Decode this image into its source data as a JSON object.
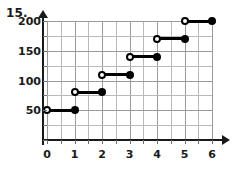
{
  "problem": {
    "number": "15."
  },
  "chart_data": {
    "type": "line",
    "title": "",
    "xlabel": "",
    "ylabel": "",
    "xlim": [
      0,
      6
    ],
    "ylim": [
      0,
      200
    ],
    "grid": true,
    "legend": null,
    "x_ticks": [
      "0",
      "1",
      "2",
      "3",
      "4",
      "5",
      "6"
    ],
    "x_tick_values": [
      0,
      1,
      2,
      3,
      4,
      5,
      6
    ],
    "x_minor_step": 0.5,
    "y_ticks": [
      "50",
      "100",
      "150",
      "200"
    ],
    "y_tick_values": [
      50,
      100,
      150,
      200
    ],
    "y_minor_step": 25,
    "steps": [
      {
        "x_start": 0,
        "x_end": 1,
        "y": 50,
        "left_endpoint": "open",
        "right_endpoint": "closed"
      },
      {
        "x_start": 1,
        "x_end": 2,
        "y": 80,
        "left_endpoint": "open",
        "right_endpoint": "closed"
      },
      {
        "x_start": 2,
        "x_end": 3,
        "y": 110,
        "left_endpoint": "open",
        "right_endpoint": "closed"
      },
      {
        "x_start": 3,
        "x_end": 4,
        "y": 140,
        "left_endpoint": "open",
        "right_endpoint": "closed"
      },
      {
        "x_start": 4,
        "x_end": 5,
        "y": 170,
        "left_endpoint": "open",
        "right_endpoint": "closed"
      },
      {
        "x_start": 5,
        "x_end": 6,
        "y": 200,
        "left_endpoint": "open",
        "right_endpoint": "closed"
      }
    ]
  },
  "colors": {
    "plot_line": "#000000",
    "grid": "#b9b9b9",
    "axis": "#1a1a1a",
    "background": "#ffffff"
  }
}
